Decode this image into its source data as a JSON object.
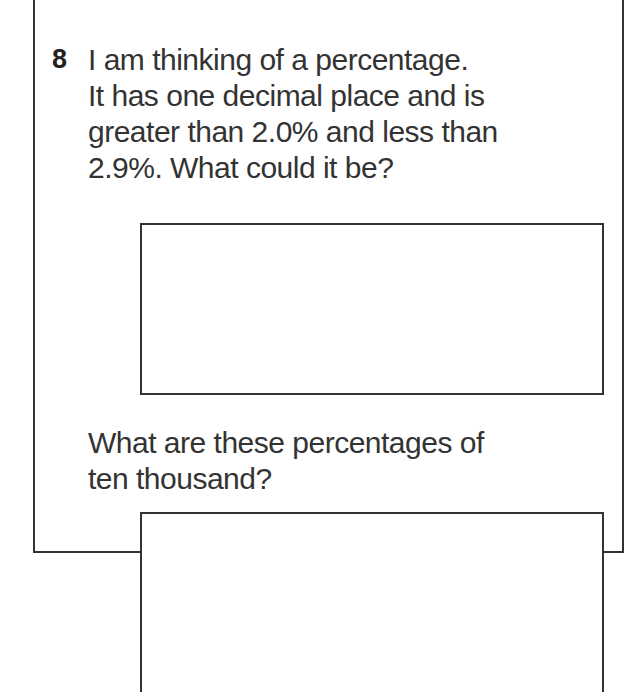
{
  "question": {
    "number": "8",
    "lines": [
      "I am thinking of a percentage.",
      "It has one decimal place and is",
      "greater than 2.0% and less than",
      "2.9%. What could it be?"
    ],
    "followup_lines": [
      "What are these percentages of",
      "ten thousand?"
    ]
  }
}
